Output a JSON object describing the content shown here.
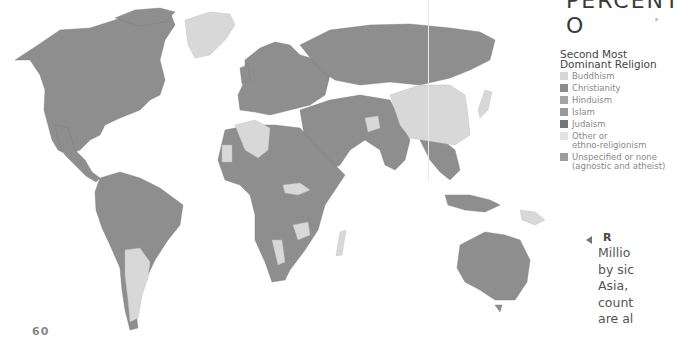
{
  "page": {
    "title_fragment": "PERCENT O",
    "page_number": "60"
  },
  "legend": {
    "title": "Second Most Dominant Religion",
    "title_line1": "Second Most",
    "title_line2": "Dominant Religion",
    "items": [
      {
        "label": "Buddhism",
        "color": "#d6d6d6"
      },
      {
        "label": "Christianity",
        "color": "#8c8c8c"
      },
      {
        "label": "Hinduism",
        "color": "#a3a3a3"
      },
      {
        "label": "Islam",
        "color": "#999999"
      },
      {
        "label": "Judaism",
        "color": "#777777"
      },
      {
        "label": "Other or ethno-religionism",
        "label_line1": "Other or",
        "label_line2": "ethno-religionism",
        "color": "#e3e3e3"
      },
      {
        "label": "Unspecified or none (agnostic and atheist)",
        "label_line1": "Unspecified or none",
        "label_line2": "(agnostic and atheist)",
        "color": "#9c9c9c"
      }
    ]
  },
  "caption": {
    "heading_fragment": "R",
    "lines": [
      "Millio",
      "by sic",
      "Asia,",
      "count",
      "are al"
    ]
  },
  "map": {
    "ocean_color": "#ffffff",
    "land_dark": "#8e8e8e",
    "land_light": "#d8d8d8"
  }
}
